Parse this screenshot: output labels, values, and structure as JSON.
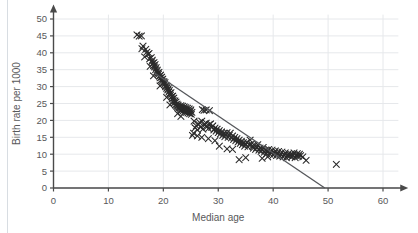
{
  "chart_data": {
    "type": "scatter",
    "title": "",
    "xlabel": "Median age",
    "ylabel": "Birth rate per 1000",
    "xlim": [
      0,
      63
    ],
    "ylim": [
      0,
      52
    ],
    "xticks": [
      0,
      10,
      20,
      30,
      40,
      50,
      60
    ],
    "yticks": [
      0,
      5,
      10,
      15,
      20,
      25,
      30,
      35,
      40,
      45,
      50
    ],
    "grid": true,
    "legend": "none",
    "marker": "x",
    "marker_color": "#2b2b2b",
    "axis_color": "#4a4a4a",
    "grid_color": "#e6e8eb",
    "trendline": {
      "label": "line of best fit",
      "color": "#55575b",
      "x_start": 18.4,
      "y_start": 34.0,
      "x_end": 49.4,
      "y_end": 0.0
    },
    "series": [
      {
        "name": "Countries",
        "points": [
          [
            15.2,
            45.3
          ],
          [
            15.6,
            44.9
          ],
          [
            16.0,
            45.0
          ],
          [
            16.3,
            42.0
          ],
          [
            16.1,
            41.2
          ],
          [
            16.8,
            41.0
          ],
          [
            17.0,
            40.2
          ],
          [
            17.2,
            39.5
          ],
          [
            17.4,
            39.8
          ],
          [
            17.5,
            38.2
          ],
          [
            17.8,
            38.6
          ],
          [
            17.9,
            37.4
          ],
          [
            18.0,
            37.8
          ],
          [
            18.1,
            36.9
          ],
          [
            18.2,
            36.2
          ],
          [
            18.3,
            37.1
          ],
          [
            18.4,
            35.8
          ],
          [
            18.5,
            36.5
          ],
          [
            18.6,
            35.0
          ],
          [
            18.7,
            35.6
          ],
          [
            18.8,
            34.4
          ],
          [
            18.9,
            34.9
          ],
          [
            19.0,
            34.0
          ],
          [
            19.1,
            33.6
          ],
          [
            19.2,
            34.2
          ],
          [
            19.3,
            33.1
          ],
          [
            19.4,
            32.6
          ],
          [
            19.5,
            33.4
          ],
          [
            19.6,
            32.0
          ],
          [
            19.7,
            32.8
          ],
          [
            19.8,
            31.6
          ],
          [
            19.9,
            32.2
          ],
          [
            20.0,
            31.0
          ],
          [
            20.1,
            31.5
          ],
          [
            20.2,
            30.6
          ],
          [
            20.3,
            31.2
          ],
          [
            20.4,
            30.0
          ],
          [
            20.5,
            30.4
          ],
          [
            20.6,
            29.5
          ],
          [
            20.7,
            30.1
          ],
          [
            20.8,
            29.0
          ],
          [
            20.9,
            29.4
          ],
          [
            21.0,
            28.4
          ],
          [
            21.1,
            28.9
          ],
          [
            21.2,
            28.0
          ],
          [
            21.3,
            27.5
          ],
          [
            21.4,
            28.2
          ],
          [
            21.5,
            27.0
          ],
          [
            21.6,
            26.4
          ],
          [
            21.7,
            27.2
          ],
          [
            21.8,
            25.9
          ],
          [
            21.9,
            26.6
          ],
          [
            22.0,
            25.2
          ],
          [
            22.1,
            25.8
          ],
          [
            22.2,
            24.6
          ],
          [
            22.3,
            25.4
          ],
          [
            22.4,
            24.2
          ],
          [
            22.5,
            24.8
          ],
          [
            22.6,
            24.0
          ],
          [
            22.7,
            24.5
          ],
          [
            22.8,
            23.6
          ],
          [
            22.9,
            24.1
          ],
          [
            23.0,
            23.2
          ],
          [
            23.1,
            23.8
          ],
          [
            23.2,
            24.4
          ],
          [
            23.3,
            23.0
          ],
          [
            23.4,
            23.5
          ],
          [
            23.5,
            24.2
          ],
          [
            23.6,
            22.8
          ],
          [
            23.7,
            23.4
          ],
          [
            23.8,
            24.0
          ],
          [
            23.9,
            22.6
          ],
          [
            24.0,
            23.2
          ],
          [
            24.1,
            23.8
          ],
          [
            24.2,
            22.4
          ],
          [
            24.3,
            23.0
          ],
          [
            24.4,
            23.6
          ],
          [
            24.5,
            22.2
          ],
          [
            24.6,
            22.8
          ],
          [
            24.7,
            23.4
          ],
          [
            24.8,
            22.0
          ],
          [
            24.9,
            22.6
          ],
          [
            25.0,
            23.1
          ],
          [
            25.1,
            21.8
          ],
          [
            25.2,
            22.4
          ],
          [
            25.3,
            15.6
          ],
          [
            25.5,
            16.2
          ],
          [
            25.8,
            17.8
          ],
          [
            26.0,
            18.4
          ],
          [
            26.2,
            17.2
          ],
          [
            26.4,
            18.9
          ],
          [
            26.6,
            19.4
          ],
          [
            26.8,
            18.0
          ],
          [
            27.0,
            19.8
          ],
          [
            27.1,
            23.2
          ],
          [
            27.4,
            23.0
          ],
          [
            27.8,
            23.1
          ],
          [
            28.4,
            22.9
          ],
          [
            27.2,
            17.4
          ],
          [
            27.5,
            18.6
          ],
          [
            27.8,
            19.2
          ],
          [
            28.0,
            18.2
          ],
          [
            28.2,
            17.6
          ],
          [
            28.4,
            18.8
          ],
          [
            28.6,
            19.0
          ],
          [
            28.8,
            17.9
          ],
          [
            29.0,
            18.4
          ],
          [
            29.2,
            17.2
          ],
          [
            29.4,
            17.7
          ],
          [
            29.6,
            16.8
          ],
          [
            29.8,
            17.4
          ],
          [
            30.0,
            16.4
          ],
          [
            30.2,
            17.0
          ],
          [
            30.4,
            16.0
          ],
          [
            30.6,
            16.6
          ],
          [
            30.8,
            15.6
          ],
          [
            31.0,
            16.2
          ],
          [
            31.2,
            15.2
          ],
          [
            31.4,
            15.8
          ],
          [
            31.6,
            16.4
          ],
          [
            31.8,
            15.0
          ],
          [
            32.0,
            15.6
          ],
          [
            32.2,
            16.2
          ],
          [
            32.4,
            14.8
          ],
          [
            32.6,
            15.4
          ],
          [
            32.8,
            14.4
          ],
          [
            33.0,
            15.0
          ],
          [
            33.2,
            14.0
          ],
          [
            33.4,
            14.6
          ],
          [
            33.6,
            13.6
          ],
          [
            33.8,
            14.2
          ],
          [
            34.0,
            13.2
          ],
          [
            34.2,
            13.8
          ],
          [
            34.4,
            12.8
          ],
          [
            34.6,
            13.4
          ],
          [
            34.8,
            12.4
          ],
          [
            35.0,
            13.0
          ],
          [
            35.2,
            13.6
          ],
          [
            35.4,
            12.2
          ],
          [
            35.6,
            12.8
          ],
          [
            35.8,
            14.2
          ],
          [
            36.0,
            13.0
          ],
          [
            36.2,
            12.4
          ],
          [
            36.4,
            11.8
          ],
          [
            36.6,
            12.6
          ],
          [
            36.8,
            11.4
          ],
          [
            37.0,
            12.0
          ],
          [
            37.2,
            12.8
          ],
          [
            37.4,
            11.2
          ],
          [
            37.6,
            11.8
          ],
          [
            37.8,
            10.8
          ],
          [
            38.0,
            11.4
          ],
          [
            38.2,
            12.0
          ],
          [
            38.4,
            10.6
          ],
          [
            38.6,
            11.2
          ],
          [
            38.8,
            10.2
          ],
          [
            39.0,
            10.8
          ],
          [
            39.2,
            11.4
          ],
          [
            39.4,
            10.0
          ],
          [
            39.6,
            10.6
          ],
          [
            39.8,
            11.2
          ],
          [
            40.0,
            9.8
          ],
          [
            40.2,
            10.4
          ],
          [
            40.4,
            11.0
          ],
          [
            40.6,
            9.6
          ],
          [
            40.8,
            10.2
          ],
          [
            41.0,
            10.8
          ],
          [
            41.2,
            9.4
          ],
          [
            41.4,
            10.0
          ],
          [
            41.6,
            10.6
          ],
          [
            41.8,
            9.2
          ],
          [
            42.0,
            9.8
          ],
          [
            42.2,
            10.4
          ],
          [
            42.4,
            9.0
          ],
          [
            42.6,
            9.6
          ],
          [
            42.8,
            10.2
          ],
          [
            43.0,
            9.4
          ],
          [
            43.2,
            10.0
          ],
          [
            43.4,
            9.2
          ],
          [
            43.6,
            9.8
          ],
          [
            43.8,
            10.4
          ],
          [
            44.0,
            9.0
          ],
          [
            44.2,
            9.6
          ],
          [
            44.4,
            10.2
          ],
          [
            44.6,
            9.4
          ],
          [
            44.8,
            10.0
          ],
          [
            45.0,
            9.6
          ],
          [
            45.4,
            9.2
          ],
          [
            46.0,
            8.2
          ],
          [
            33.8,
            8.4
          ],
          [
            35.0,
            9.0
          ],
          [
            38.0,
            8.8
          ],
          [
            39.0,
            9.2
          ],
          [
            26.2,
            15.4
          ],
          [
            27.0,
            15.0
          ],
          [
            29.4,
            14.0
          ],
          [
            31.6,
            11.6
          ],
          [
            32.6,
            11.4
          ],
          [
            30.2,
            12.4
          ],
          [
            28.2,
            14.6
          ],
          [
            25.6,
            19.8
          ],
          [
            23.2,
            21.2
          ],
          [
            22.6,
            22.0
          ],
          [
            21.2,
            24.6
          ],
          [
            20.6,
            26.8
          ],
          [
            19.4,
            30.2
          ],
          [
            18.2,
            33.2
          ],
          [
            17.6,
            36.0
          ],
          [
            16.6,
            38.8
          ],
          [
            51.5,
            7.0
          ]
        ]
      }
    ]
  },
  "axes": {
    "x_tick_labels": [
      "0",
      "10",
      "20",
      "30",
      "40",
      "50",
      "60"
    ],
    "y_tick_labels": [
      "0",
      "5",
      "10",
      "15",
      "20",
      "25",
      "30",
      "35",
      "40",
      "45",
      "50"
    ],
    "x_title": "Median age",
    "y_title": "Birth rate per 1000"
  },
  "figure": {
    "clipped_caption": ""
  }
}
